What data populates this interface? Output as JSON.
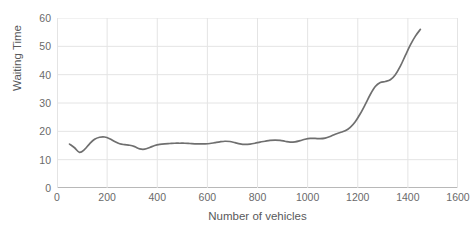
{
  "chart_data": {
    "type": "line",
    "title": "",
    "xlabel": "Number of vehicles",
    "ylabel": "Waiting Time",
    "xlim": [
      0,
      1600
    ],
    "ylim": [
      0,
      60
    ],
    "xticks": [
      0,
      200,
      400,
      600,
      800,
      1000,
      1200,
      1400,
      1600
    ],
    "yticks": [
      0,
      10,
      20,
      30,
      40,
      50,
      60
    ],
    "grid": true,
    "legend": false,
    "series": [
      {
        "name": "Waiting Time",
        "color": "#6f6f6f",
        "x": [
          50,
          70,
          90,
          110,
          130,
          150,
          170,
          190,
          210,
          230,
          250,
          270,
          290,
          310,
          330,
          350,
          370,
          390,
          410,
          430,
          450,
          470,
          490,
          510,
          530,
          550,
          570,
          590,
          610,
          630,
          650,
          670,
          690,
          710,
          730,
          750,
          770,
          790,
          810,
          830,
          850,
          870,
          890,
          910,
          930,
          950,
          970,
          990,
          1010,
          1030,
          1050,
          1070,
          1090,
          1110,
          1130,
          1150,
          1170,
          1190,
          1210,
          1230,
          1250,
          1270,
          1290,
          1310,
          1330,
          1350,
          1370,
          1390,
          1410,
          1430,
          1450
        ],
        "y": [
          15.5,
          14.2,
          12.6,
          13.6,
          15.6,
          17.2,
          17.9,
          18.0,
          17.4,
          16.4,
          15.6,
          15.3,
          15.1,
          14.6,
          13.8,
          13.7,
          14.3,
          15.0,
          15.4,
          15.6,
          15.7,
          15.8,
          15.8,
          15.8,
          15.7,
          15.6,
          15.6,
          15.6,
          15.7,
          16.0,
          16.3,
          16.5,
          16.4,
          16.0,
          15.6,
          15.4,
          15.5,
          15.8,
          16.2,
          16.5,
          16.8,
          16.9,
          16.8,
          16.5,
          16.2,
          16.3,
          16.7,
          17.2,
          17.5,
          17.5,
          17.4,
          17.6,
          18.2,
          19.0,
          19.6,
          20.2,
          21.4,
          23.4,
          26.2,
          29.5,
          33.0,
          35.8,
          37.2,
          37.6,
          38.2,
          40.0,
          43.0,
          46.8,
          50.5,
          53.6,
          56.0
        ]
      }
    ]
  }
}
